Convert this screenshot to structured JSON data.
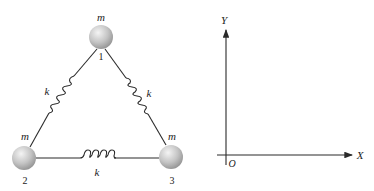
{
  "diagram": {
    "masses": [
      {
        "id": "1",
        "label": "m",
        "number": "1"
      },
      {
        "id": "2",
        "label": "m",
        "number": "2"
      },
      {
        "id": "3",
        "label": "m",
        "number": "3"
      }
    ],
    "springs": [
      {
        "between": "1-2",
        "label": "k"
      },
      {
        "between": "1-3",
        "label": "k"
      },
      {
        "between": "2-3",
        "label": "k"
      }
    ],
    "axes": {
      "x_label": "X",
      "y_label": "Y",
      "origin_label": "O"
    },
    "colors": {
      "line": "#2a2a2a",
      "ball_light": "#f2f2f2",
      "ball_dark": "#8a8a8a"
    }
  }
}
